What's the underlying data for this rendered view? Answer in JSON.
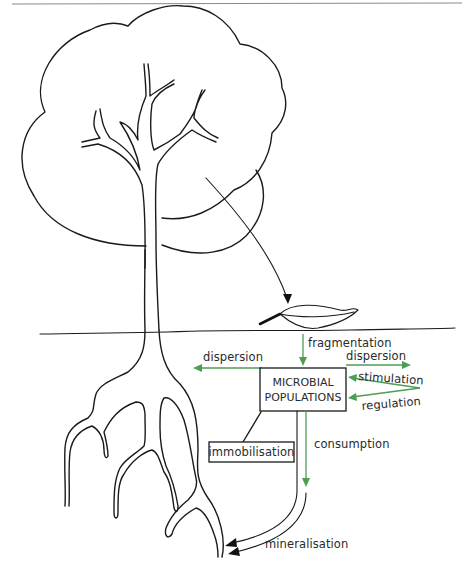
{
  "diagram": {
    "type": "nutrient-cycling-illustration",
    "colors": {
      "ink": "#1a1a1a",
      "flow_green": "#4c9e55",
      "background": "#ffffff"
    },
    "nodes": {
      "microbial_box": {
        "line1": "MICROBIAL",
        "line2": "POPULATIONS"
      },
      "immobilisation_box": {
        "label": "immobilisation"
      }
    },
    "labels": {
      "fragmentation": "fragmentation",
      "dispersion_left": "dispersion",
      "dispersion_right": "dispersion",
      "stimulation": "stimulation",
      "regulation": "regulation",
      "consumption": "consumption",
      "mineralisation": "mineralisation"
    },
    "illustrations": {
      "tree": "tree with canopy, trunk and roots",
      "leaf": "fallen leaf on soil surface",
      "soil_line": "ground surface"
    },
    "edges": [
      {
        "from": "tree canopy",
        "to": "leaf",
        "color": "black",
        "label": ""
      },
      {
        "from": "leaf",
        "to": "MICROBIAL POPULATIONS",
        "color": "green",
        "label": "fragmentation"
      },
      {
        "from": "MICROBIAL POPULATIONS",
        "to": "left (roots)",
        "color": "green",
        "label": "dispersion"
      },
      {
        "from": "MICROBIAL POPULATIONS",
        "to": "right",
        "color": "green",
        "label": "dispersion"
      },
      {
        "from": "right",
        "to": "MICROBIAL POPULATIONS",
        "color": "green",
        "label": "stimulation"
      },
      {
        "from": "right",
        "to": "MICROBIAL POPULATIONS",
        "color": "green",
        "label": "regulation"
      },
      {
        "from": "MICROBIAL POPULATIONS",
        "to": "immobilisation",
        "color": "black",
        "label": ""
      },
      {
        "from": "MICROBIAL POPULATIONS",
        "to": "down",
        "color": "green",
        "label": "consumption"
      },
      {
        "from": "MICROBIAL POPULATIONS",
        "to": "root tip",
        "color": "black",
        "label": "mineralisation"
      }
    ]
  }
}
